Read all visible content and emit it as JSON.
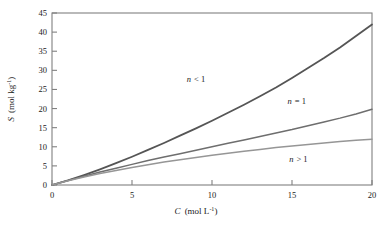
{
  "figure": {
    "background_color": "#ffffff",
    "width": 389,
    "height": 229
  },
  "axes": {
    "frame_color": "#808080",
    "x_title_var": "C",
    "x_title_units": "(mol L",
    "x_title_exp": "-1",
    "x_title_close": ")",
    "y_title_var": "S",
    "y_title_units": "(mol kg",
    "y_title_exp": "-1",
    "y_title_close": ")",
    "x_ticks": [
      "0",
      "5",
      "10",
      "15",
      "20"
    ],
    "y_ticks": [
      "0",
      "5",
      "10",
      "15",
      "20",
      "25",
      "30",
      "35",
      "40",
      "45"
    ]
  },
  "annotations": {
    "curve_upper": "n < 1",
    "curve_upper_var": "n",
    "curve_upper_rel": "< 1",
    "curve_middle_var": "n",
    "curve_middle_rel": "= 1",
    "curve_lower_var": "n",
    "curve_lower_rel": "> 1"
  },
  "chart_data": {
    "type": "line",
    "title": "",
    "xlabel": "C (mol L^-1)",
    "ylabel": "S (mol kg^-1)",
    "xlim": [
      0,
      20
    ],
    "ylim": [
      0,
      45
    ],
    "xticks": [
      0,
      5,
      10,
      15,
      20
    ],
    "yticks": [
      0,
      5,
      10,
      15,
      20,
      25,
      30,
      35,
      40,
      45
    ],
    "grid": false,
    "legend": "inline-annotations",
    "x": [
      0,
      1,
      2,
      3,
      4,
      5,
      6,
      7,
      8,
      9,
      10,
      11,
      12,
      13,
      14,
      15,
      16,
      17,
      18,
      19,
      20
    ],
    "series": [
      {
        "name": "n < 1",
        "color": "#555555",
        "linewidth": 1.8,
        "label_position": {
          "x": 9.0,
          "y": 27.0
        },
        "values": [
          0.0,
          1.2,
          2.6,
          4.1,
          5.7,
          7.4,
          9.2,
          11.0,
          12.9,
          14.8,
          16.8,
          18.9,
          21.0,
          23.2,
          25.5,
          28.0,
          30.6,
          33.2,
          36.0,
          39.0,
          42.0
        ]
      },
      {
        "name": "n = 1",
        "color": "#6e6e6e",
        "linewidth": 1.5,
        "label_position": {
          "x": 15.3,
          "y": 21.3
        },
        "values": [
          0.0,
          1.2,
          2.3,
          3.4,
          4.4,
          5.4,
          6.4,
          7.3,
          8.2,
          9.1,
          10.0,
          10.9,
          11.8,
          12.7,
          13.6,
          14.5,
          15.5,
          16.5,
          17.5,
          18.6,
          19.8
        ]
      },
      {
        "name": "n > 1",
        "color": "#969696",
        "linewidth": 1.5,
        "label_position": {
          "x": 15.4,
          "y": 6.0
        },
        "values": [
          0.0,
          1.1,
          2.1,
          3.0,
          3.8,
          4.6,
          5.3,
          6.0,
          6.6,
          7.2,
          7.8,
          8.3,
          8.8,
          9.3,
          9.8,
          10.2,
          10.6,
          11.0,
          11.4,
          11.7,
          12.0
        ]
      }
    ]
  }
}
